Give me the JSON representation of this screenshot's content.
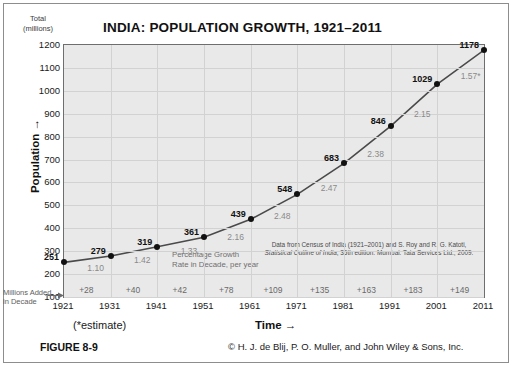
{
  "figure": {
    "number": "FIGURE 8-9",
    "copyright": "© H. J. de Blij, P. O. Muller, and John Wiley & Sons, Inc.",
    "estimate_note": "(*estimate)"
  },
  "axes": {
    "y_unit_line1": "Total",
    "y_unit_line2": "(millions)",
    "y_title": "Population →",
    "x_title": "Time →",
    "added_label_line1": "Millions Added",
    "added_label_line2": "in Decade"
  },
  "notes": {
    "growth_rate_line1": "Percentage Growth",
    "growth_rate_line2": "Rate in Decade, per year",
    "source_line1": "Data from Census of India (1921–2001) and S. Roy and R. G. Katoti,",
    "source_line2_italic": "Statistical Outline of India",
    "source_line2_rest": ", 35th edition. Mumbai: Tata Services Ltd., 2009."
  },
  "chart_data": {
    "type": "line",
    "title": "INDIA: POPULATION GROWTH, 1921–2011",
    "xlabel": "Time",
    "ylabel": "Population",
    "y_unit": "Total (millions)",
    "grid": true,
    "legend_position": "none",
    "xlim": [
      1921,
      2011
    ],
    "ylim": [
      100,
      1200
    ],
    "y_ticks": [
      1200,
      1100,
      1000,
      900,
      800,
      700,
      600,
      500,
      400,
      300,
      200,
      100
    ],
    "x_ticks": [
      1921,
      1931,
      1941,
      1951,
      1961,
      1971,
      1981,
      1991,
      2001,
      2011
    ],
    "x": [
      1921,
      1931,
      1941,
      1951,
      1961,
      1971,
      1981,
      1991,
      2001,
      2011
    ],
    "values": [
      251,
      279,
      319,
      361,
      439,
      548,
      683,
      846,
      1029,
      1178
    ],
    "point_labels": [
      "251",
      "279",
      "319",
      "361",
      "439",
      "548",
      "683",
      "846",
      "1029",
      "1178"
    ],
    "annotations": {
      "growth_rate_per_year": [
        "1.10",
        "1.42",
        "1.33",
        "2.16",
        "2.48",
        "2.47",
        "2.38",
        "2.15",
        "1.57*"
      ],
      "millions_added_in_decade": [
        "+28",
        "+40",
        "+42",
        "+78",
        "+109",
        "+135",
        "+163",
        "+183",
        "+149"
      ]
    }
  }
}
